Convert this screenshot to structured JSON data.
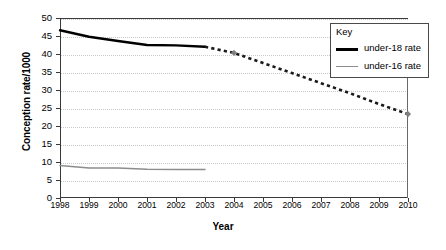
{
  "chart_data": {
    "type": "line",
    "title": "",
    "xlabel": "Year",
    "ylabel": "Conception rate/1000",
    "xlim": [
      1998,
      2010
    ],
    "ylim": [
      0,
      50
    ],
    "grid": true,
    "legend_position": "top-right",
    "x": [
      1998,
      1999,
      2000,
      2001,
      2002,
      2003,
      2004,
      2005,
      2006,
      2007,
      2008,
      2009,
      2010
    ],
    "xticklabels": [
      "1998",
      "1999",
      "2000",
      "2001",
      "2002",
      "2003",
      "2004",
      "2005",
      "2006",
      "2007",
      "2008",
      "2009",
      "2010"
    ],
    "yticks": [
      0,
      5,
      10,
      15,
      20,
      25,
      30,
      35,
      40,
      45,
      50
    ],
    "yticklabels": [
      "0",
      "5",
      "10",
      "15",
      "20",
      "25",
      "30",
      "35",
      "40",
      "45",
      "50"
    ],
    "series": [
      {
        "name": "under-18 rate",
        "color": "#000000",
        "style": "solid",
        "width": 2.4,
        "x": [
          1998,
          1999,
          2000,
          2001,
          2002,
          2003
        ],
        "values": [
          46.6,
          44.8,
          43.6,
          42.5,
          42.4,
          42.0
        ]
      },
      {
        "name": "under-18 rate projection",
        "color": "#1a1a1a",
        "style": "dotted",
        "width": 2.6,
        "x": [
          2003,
          2004,
          2005,
          2006,
          2007,
          2008,
          2009,
          2010
        ],
        "values": [
          42.0,
          40.3,
          37.5,
          34.7,
          31.9,
          29.1,
          26.1,
          23.3
        ],
        "markers": [
          {
            "x": 2004,
            "y": 40.3
          },
          {
            "x": 2010,
            "y": 23.3
          }
        ],
        "marker_color": "#808080"
      },
      {
        "name": "under-16 rate",
        "color": "#8d8d8d",
        "style": "solid",
        "width": 1.5,
        "x": [
          1998,
          1999,
          2000,
          2001,
          2002,
          2003
        ],
        "values": [
          9.0,
          8.3,
          8.3,
          8.0,
          7.9,
          7.9
        ]
      }
    ]
  },
  "legend": {
    "title": "Key",
    "entries": [
      {
        "label": "under-18 rate",
        "swatch": "thick"
      },
      {
        "label": "under-16 rate",
        "swatch": "thin"
      }
    ]
  }
}
